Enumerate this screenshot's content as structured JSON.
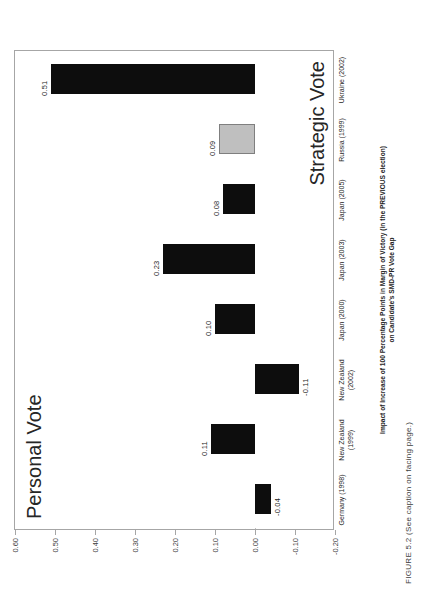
{
  "figure": {
    "caption": "FIGURE 5.2  (See caption on facing page.)"
  },
  "annotations": {
    "personal_vote": "Personal Vote",
    "strategic_vote": "Strategic Vote"
  },
  "chart_data": {
    "type": "bar",
    "orientation": "vertical",
    "title": "",
    "xlabel": "",
    "ylabel_line1": "Impact of Increase of 100 Percentage Points in Margin of Victory (in the PREVIOUS election)",
    "ylabel_line2": "on Candidate's SMD-PR Vote Gap",
    "categories": [
      "Germany (1998)",
      "New Zealand\n(1999)",
      "New Zealand\n(2002)",
      "Japan (2000)",
      "Japan (2003)",
      "Japan (2005)",
      "Russia (1999)",
      "Ukraine (2002)"
    ],
    "values": [
      -0.04,
      0.11,
      -0.11,
      0.1,
      0.23,
      0.08,
      0.09,
      0.51
    ],
    "value_labels": [
      "-0.04",
      "0.11",
      "-0.11",
      "0.10",
      "0.23",
      "0.08",
      "0.09",
      "0.51"
    ],
    "bar_colors": [
      "black",
      "black",
      "black",
      "black",
      "black",
      "black",
      "gray",
      "black"
    ],
    "ylim": [
      -0.2,
      0.6
    ],
    "yticks": [
      0.6,
      0.5,
      0.4,
      0.3,
      0.2,
      0.1,
      0.0,
      -0.1,
      -0.2
    ],
    "ytick_labels": [
      "0.60",
      "0.50",
      "0.40",
      "0.30",
      "0.20",
      "0.10",
      "0.00",
      "-0.10",
      "-0.20"
    ],
    "grid": false,
    "legend": "none",
    "colors": {
      "black": "#0d0d0d",
      "gray": "#bfbfbf",
      "gray_border": "#7f7f7f",
      "frame": "#a6a6a6"
    }
  }
}
